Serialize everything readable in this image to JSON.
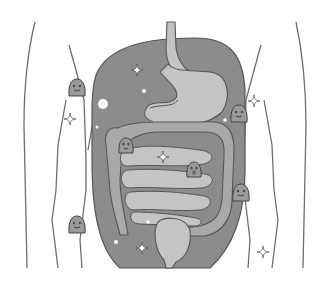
{
  "illustration": {
    "subject": "abdomen-digestive-tract",
    "colors": {
      "background": "#ffffff",
      "cavity": "#8c8c8c",
      "organ_light": "#c4c4c4",
      "organ_mid": "#a9a9a9",
      "outline": "#555555",
      "body_line": "#6e6e6e",
      "sparkle": "#ffffff",
      "character": "#9a9a9a"
    },
    "elements": [
      "esophagus",
      "stomach",
      "large-intestine",
      "small-intestine",
      "rectum",
      "sparkles",
      "bacteria-characters",
      "body-outline"
    ],
    "characters_count": 6
  }
}
